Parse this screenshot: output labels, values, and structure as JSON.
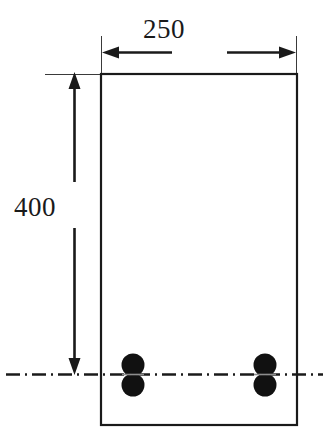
{
  "drawing": {
    "type": "reinforced-concrete-beam-cross-section",
    "units": "mm",
    "background_color": "#ffffff",
    "line_color": "#1a1a1a",
    "rebar_color": "#111111"
  },
  "dimensions": {
    "width": {
      "label": "250",
      "orientation": "horizontal",
      "position": "top",
      "arrow_style": "outward-pointing"
    },
    "height": {
      "label": "400",
      "orientation": "vertical",
      "position": "left",
      "arrow_style": "outward-pointing"
    }
  },
  "section": {
    "outline": {
      "shape": "rectangle",
      "x": 101,
      "y": 74,
      "width": 196,
      "height": 351,
      "stroke_width": 2.2
    }
  },
  "reinforcement": {
    "description": "two bundles of two longitudinal bars each, near the bottom",
    "bar_groups": [
      {
        "name": "left-rebar-group",
        "center_x": 133,
        "bars": [
          {
            "name": "upper-bar",
            "cx": 133,
            "cy": 365,
            "r": 11.5
          },
          {
            "name": "lower-bar",
            "cx": 133,
            "cy": 385,
            "r": 11.5
          }
        ]
      },
      {
        "name": "right-rebar-group",
        "center_x": 265,
        "bars": [
          {
            "name": "upper-bar",
            "cx": 265,
            "cy": 365,
            "r": 11.5
          },
          {
            "name": "lower-bar",
            "cx": 265,
            "cy": 385,
            "r": 11.5
          }
        ]
      }
    ]
  },
  "centerline": {
    "name": "rebar-centroid-axis",
    "style": "dash-dot",
    "y": 374,
    "x_start": 6,
    "x_end": 323
  }
}
